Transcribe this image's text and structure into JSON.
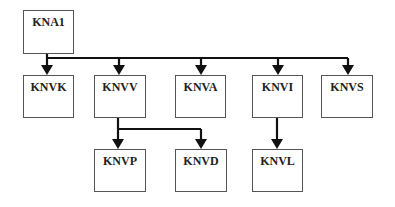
{
  "diagram": {
    "type": "hierarchy",
    "nodes": [
      {
        "id": "KNA1",
        "label": "KNA1",
        "level": 0
      },
      {
        "id": "KNVK",
        "label": "KNVK",
        "level": 1
      },
      {
        "id": "KNVV",
        "label": "KNVV",
        "level": 1
      },
      {
        "id": "KNVA",
        "label": "KNVA",
        "level": 1
      },
      {
        "id": "KNVI",
        "label": "KNVI",
        "level": 1
      },
      {
        "id": "KNVS",
        "label": "KNVS",
        "level": 1
      },
      {
        "id": "KNVP",
        "label": "KNVP",
        "level": 2
      },
      {
        "id": "KNVD",
        "label": "KNVD",
        "level": 2
      },
      {
        "id": "KNVL",
        "label": "KNVL",
        "level": 2
      }
    ],
    "edges": [
      {
        "from": "KNA1",
        "to": "KNVK"
      },
      {
        "from": "KNA1",
        "to": "KNVV"
      },
      {
        "from": "KNA1",
        "to": "KNVA"
      },
      {
        "from": "KNA1",
        "to": "KNVI"
      },
      {
        "from": "KNA1",
        "to": "KNVS"
      },
      {
        "from": "KNVV",
        "to": "KNVP"
      },
      {
        "from": "KNVV",
        "to": "KNVD"
      },
      {
        "from": "KNVI",
        "to": "KNVL"
      }
    ]
  }
}
